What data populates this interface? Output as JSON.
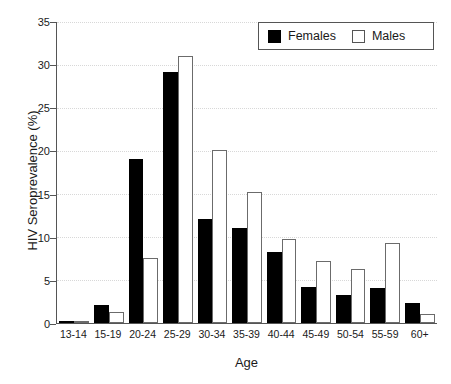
{
  "chart_data": {
    "type": "bar",
    "title": "",
    "xlabel": "Age",
    "ylabel": "HIV Seroprevalence (%)",
    "ylim": [
      0,
      35
    ],
    "ytick_values": [
      0,
      5,
      10,
      15,
      20,
      25,
      30,
      35
    ],
    "ytick_labels": [
      "0",
      "5",
      "10",
      "15",
      "20",
      "25",
      "30",
      "35"
    ],
    "grid": true,
    "grid_style": "dotted-horizontal",
    "legend_position": "top-right",
    "categories": [
      "13-14",
      "15-19",
      "20-24",
      "25-29",
      "30-34",
      "35-39",
      "40-44",
      "45-49",
      "50-54",
      "55-59",
      "60+"
    ],
    "series": [
      {
        "name": "Females",
        "color": "#000000",
        "fill": "solid",
        "values": [
          0.2,
          2.1,
          19.1,
          29.2,
          12.1,
          11.1,
          8.2,
          4.2,
          3.2,
          4.1,
          2.3
        ]
      },
      {
        "name": "Males",
        "color": "#ffffff",
        "fill": "open",
        "values": [
          0.2,
          1.3,
          7.6,
          31.1,
          20.1,
          15.2,
          9.8,
          7.2,
          6.3,
          9.3,
          1.0
        ]
      }
    ]
  },
  "colors": {
    "axis": "#555555",
    "grid": "#d8d8d8",
    "female": "#000000",
    "male_outline": "#6b6b6b",
    "background": "#ffffff"
  }
}
